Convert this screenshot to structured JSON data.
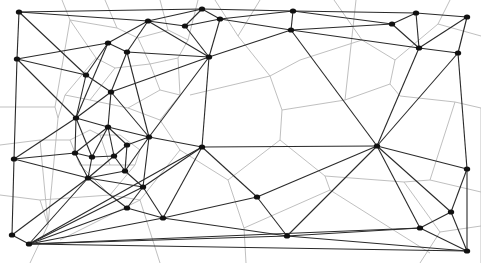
{
  "diagram": {
    "type": "delaunay-voronoi",
    "width": 481,
    "height": 263,
    "colors": {
      "delaunay": "#2a2a2a",
      "voronoi": "#b8b8b8",
      "site": "#111111",
      "background": "#ffffff"
    },
    "nodes": [
      {
        "id": 0,
        "x": 19,
        "y": 12
      },
      {
        "id": 1,
        "x": 17,
        "y": 59
      },
      {
        "id": 2,
        "x": 14,
        "y": 159
      },
      {
        "id": 3,
        "x": 12,
        "y": 235
      },
      {
        "id": 4,
        "x": 29,
        "y": 244
      },
      {
        "id": 5,
        "x": 108,
        "y": 43
      },
      {
        "id": 6,
        "x": 148,
        "y": 21
      },
      {
        "id": 7,
        "x": 127,
        "y": 52
      },
      {
        "id": 8,
        "x": 86,
        "y": 75
      },
      {
        "id": 9,
        "x": 111,
        "y": 92
      },
      {
        "id": 10,
        "x": 76,
        "y": 118
      },
      {
        "id": 11,
        "x": 108,
        "y": 127
      },
      {
        "id": 12,
        "x": 149,
        "y": 137
      },
      {
        "id": 13,
        "x": 127,
        "y": 145
      },
      {
        "id": 14,
        "x": 75,
        "y": 153
      },
      {
        "id": 15,
        "x": 92,
        "y": 157
      },
      {
        "id": 16,
        "x": 114,
        "y": 156
      },
      {
        "id": 17,
        "x": 125,
        "y": 171
      },
      {
        "id": 18,
        "x": 88,
        "y": 178
      },
      {
        "id": 19,
        "x": 143,
        "y": 187
      },
      {
        "id": 20,
        "x": 127,
        "y": 208
      },
      {
        "id": 21,
        "x": 163,
        "y": 218
      },
      {
        "id": 22,
        "x": 202,
        "y": 9
      },
      {
        "id": 23,
        "x": 185,
        "y": 26
      },
      {
        "id": 24,
        "x": 220,
        "y": 19
      },
      {
        "id": 25,
        "x": 209,
        "y": 57
      },
      {
        "id": 26,
        "x": 202,
        "y": 147
      },
      {
        "id": 27,
        "x": 257,
        "y": 197
      },
      {
        "id": 28,
        "x": 287,
        "y": 236
      },
      {
        "id": 29,
        "x": 293,
        "y": 11
      },
      {
        "id": 30,
        "x": 291,
        "y": 30
      },
      {
        "id": 31,
        "x": 392,
        "y": 24
      },
      {
        "id": 32,
        "x": 416,
        "y": 13
      },
      {
        "id": 33,
        "x": 419,
        "y": 48
      },
      {
        "id": 34,
        "x": 467,
        "y": 17
      },
      {
        "id": 35,
        "x": 458,
        "y": 53
      },
      {
        "id": 36,
        "x": 377,
        "y": 146
      },
      {
        "id": 37,
        "x": 467,
        "y": 169
      },
      {
        "id": 38,
        "x": 451,
        "y": 212
      },
      {
        "id": 39,
        "x": 420,
        "y": 228
      },
      {
        "id": 40,
        "x": 467,
        "y": 251
      }
    ],
    "edges": [
      [
        0,
        1
      ],
      [
        0,
        6
      ],
      [
        0,
        8
      ],
      [
        0,
        22
      ],
      [
        1,
        8
      ],
      [
        1,
        10
      ],
      [
        1,
        2
      ],
      [
        1,
        5
      ],
      [
        2,
        14
      ],
      [
        2,
        10
      ],
      [
        2,
        3
      ],
      [
        2,
        18
      ],
      [
        3,
        4
      ],
      [
        3,
        18
      ],
      [
        4,
        18
      ],
      [
        4,
        20
      ],
      [
        4,
        21
      ],
      [
        4,
        28
      ],
      [
        4,
        40
      ],
      [
        4,
        26
      ],
      [
        4,
        19
      ],
      [
        4,
        39
      ],
      [
        5,
        6
      ],
      [
        5,
        8
      ],
      [
        5,
        7
      ],
      [
        5,
        10
      ],
      [
        6,
        22
      ],
      [
        6,
        23
      ],
      [
        6,
        25
      ],
      [
        6,
        7
      ],
      [
        7,
        9
      ],
      [
        7,
        25
      ],
      [
        7,
        12
      ],
      [
        8,
        9
      ],
      [
        8,
        10
      ],
      [
        9,
        10
      ],
      [
        9,
        11
      ],
      [
        9,
        12
      ],
      [
        9,
        25
      ],
      [
        10,
        11
      ],
      [
        10,
        14
      ],
      [
        10,
        15
      ],
      [
        11,
        12
      ],
      [
        11,
        13
      ],
      [
        11,
        15
      ],
      [
        11,
        16
      ],
      [
        11,
        14
      ],
      [
        12,
        13
      ],
      [
        12,
        25
      ],
      [
        12,
        26
      ],
      [
        12,
        19
      ],
      [
        12,
        17
      ],
      [
        13,
        16
      ],
      [
        13,
        17
      ],
      [
        14,
        15
      ],
      [
        14,
        18
      ],
      [
        15,
        16
      ],
      [
        15,
        18
      ],
      [
        16,
        17
      ],
      [
        16,
        18
      ],
      [
        17,
        18
      ],
      [
        17,
        19
      ],
      [
        18,
        20
      ],
      [
        18,
        19
      ],
      [
        19,
        20
      ],
      [
        19,
        21
      ],
      [
        19,
        26
      ],
      [
        20,
        21
      ],
      [
        21,
        26
      ],
      [
        21,
        27
      ],
      [
        21,
        28
      ],
      [
        22,
        23
      ],
      [
        22,
        24
      ],
      [
        22,
        29
      ],
      [
        23,
        25
      ],
      [
        23,
        24
      ],
      [
        24,
        25
      ],
      [
        24,
        30
      ],
      [
        24,
        29
      ],
      [
        25,
        30
      ],
      [
        25,
        26
      ],
      [
        26,
        36
      ],
      [
        26,
        27
      ],
      [
        27,
        36
      ],
      [
        27,
        28
      ],
      [
        28,
        40
      ],
      [
        28,
        39
      ],
      [
        29,
        30
      ],
      [
        29,
        32
      ],
      [
        29,
        31
      ],
      [
        30,
        31
      ],
      [
        30,
        33
      ],
      [
        30,
        36
      ],
      [
        31,
        32
      ],
      [
        31,
        33
      ],
      [
        32,
        33
      ],
      [
        32,
        34
      ],
      [
        33,
        34
      ],
      [
        33,
        35
      ],
      [
        33,
        36
      ],
      [
        34,
        35
      ],
      [
        35,
        36
      ],
      [
        35,
        37
      ],
      [
        36,
        37
      ],
      [
        36,
        38
      ],
      [
        36,
        39
      ],
      [
        36,
        28
      ],
      [
        37,
        38
      ],
      [
        37,
        40
      ],
      [
        38,
        39
      ],
      [
        38,
        40
      ],
      [
        39,
        40
      ]
    ],
    "voronoi_edges": [
      [
        [
          0,
          107
        ],
        [
          55,
          107
        ]
      ],
      [
        [
          55,
          107
        ],
        [
          58,
          118
        ]
      ],
      [
        [
          55,
          107
        ],
        [
          70,
          20
        ]
      ],
      [
        [
          58,
          118
        ],
        [
          48,
          225
        ]
      ],
      [
        [
          70,
          20
        ],
        [
          62,
          0
        ]
      ],
      [
        [
          105,
          0
        ],
        [
          117,
          28
        ]
      ],
      [
        [
          117,
          28
        ],
        [
          70,
          20
        ]
      ],
      [
        [
          117,
          28
        ],
        [
          138,
          38
        ]
      ],
      [
        [
          138,
          38
        ],
        [
          150,
          64
        ]
      ],
      [
        [
          150,
          64
        ],
        [
          115,
          68
        ]
      ],
      [
        [
          115,
          68
        ],
        [
          96,
          58
        ]
      ],
      [
        [
          96,
          58
        ],
        [
          70,
          20
        ]
      ],
      [
        [
          96,
          58
        ],
        [
          65,
          95
        ]
      ],
      [
        [
          65,
          95
        ],
        [
          90,
          100
        ]
      ],
      [
        [
          90,
          100
        ],
        [
          115,
          68
        ]
      ],
      [
        [
          65,
          95
        ],
        [
          58,
          118
        ]
      ],
      [
        [
          150,
          64
        ],
        [
          160,
          90
        ]
      ],
      [
        [
          160,
          90
        ],
        [
          128,
          108
        ]
      ],
      [
        [
          128,
          108
        ],
        [
          90,
          100
        ]
      ],
      [
        [
          160,
          0
        ],
        [
          168,
          30
        ]
      ],
      [
        [
          168,
          30
        ],
        [
          138,
          38
        ]
      ],
      [
        [
          168,
          30
        ],
        [
          188,
          40
        ]
      ],
      [
        [
          188,
          40
        ],
        [
          198,
          0
        ]
      ],
      [
        [
          188,
          40
        ],
        [
          178,
          58
        ]
      ],
      [
        [
          178,
          58
        ],
        [
          150,
          64
        ]
      ],
      [
        [
          178,
          58
        ],
        [
          180,
          95
        ]
      ],
      [
        [
          180,
          95
        ],
        [
          160,
          90
        ]
      ],
      [
        [
          215,
          0
        ],
        [
          238,
          36
        ]
      ],
      [
        [
          238,
          36
        ],
        [
          260,
          0
        ]
      ],
      [
        [
          238,
          36
        ],
        [
          270,
          76
        ]
      ],
      [
        [
          270,
          76
        ],
        [
          190,
          95
        ]
      ],
      [
        [
          270,
          76
        ],
        [
          282,
          110
        ]
      ],
      [
        [
          282,
          110
        ],
        [
          280,
          140
        ]
      ],
      [
        [
          280,
          140
        ],
        [
          228,
          180
        ]
      ],
      [
        [
          228,
          180
        ],
        [
          180,
          150
        ]
      ],
      [
        [
          180,
          150
        ],
        [
          160,
          120
        ]
      ],
      [
        [
          160,
          120
        ],
        [
          180,
          95
        ]
      ],
      [
        [
          282,
          110
        ],
        [
          345,
          100
        ]
      ],
      [
        [
          345,
          100
        ],
        [
          390,
          84
        ]
      ],
      [
        [
          345,
          100
        ],
        [
          356,
          0
        ]
      ],
      [
        [
          390,
          84
        ],
        [
          400,
          96
        ]
      ],
      [
        [
          400,
          96
        ],
        [
          455,
          102
        ]
      ],
      [
        [
          455,
          102
        ],
        [
          481,
          108
        ]
      ],
      [
        [
          390,
          84
        ],
        [
          395,
          60
        ]
      ],
      [
        [
          395,
          60
        ],
        [
          438,
          24
        ]
      ],
      [
        [
          438,
          24
        ],
        [
          450,
          0
        ]
      ],
      [
        [
          438,
          24
        ],
        [
          481,
          36
        ]
      ],
      [
        [
          395,
          60
        ],
        [
          362,
          40
        ]
      ],
      [
        [
          362,
          40
        ],
        [
          334,
          0
        ]
      ],
      [
        [
          362,
          40
        ],
        [
          300,
          60
        ]
      ],
      [
        [
          300,
          60
        ],
        [
          270,
          76
        ]
      ],
      [
        [
          455,
          102
        ],
        [
          430,
          180
        ]
      ],
      [
        [
          430,
          180
        ],
        [
          404,
          182
        ]
      ],
      [
        [
          404,
          182
        ],
        [
          325,
          176
        ]
      ],
      [
        [
          325,
          176
        ],
        [
          280,
          140
        ]
      ],
      [
        [
          430,
          180
        ],
        [
          481,
          192
        ]
      ],
      [
        [
          325,
          176
        ],
        [
          330,
          190
        ]
      ],
      [
        [
          330,
          190
        ],
        [
          430,
          253
        ]
      ],
      [
        [
          404,
          182
        ],
        [
          440,
          232
        ]
      ],
      [
        [
          440,
          232
        ],
        [
          481,
          226
        ]
      ],
      [
        [
          440,
          232
        ],
        [
          420,
          263
        ]
      ],
      [
        [
          330,
          190
        ],
        [
          244,
          228
        ]
      ],
      [
        [
          244,
          228
        ],
        [
          228,
          180
        ]
      ],
      [
        [
          244,
          228
        ],
        [
          246,
          263
        ]
      ],
      [
        [
          160,
          120
        ],
        [
          128,
          108
        ]
      ],
      [
        [
          180,
          150
        ],
        [
          140,
          200
        ]
      ],
      [
        [
          140,
          200
        ],
        [
          60,
          240
        ]
      ],
      [
        [
          140,
          200
        ],
        [
          160,
          263
        ]
      ],
      [
        [
          110,
          195
        ],
        [
          40,
          200
        ]
      ],
      [
        [
          40,
          200
        ],
        [
          0,
          195
        ]
      ],
      [
        [
          40,
          200
        ],
        [
          48,
          225
        ]
      ],
      [
        [
          48,
          225
        ],
        [
          30,
          263
        ]
      ],
      [
        [
          70,
          140
        ],
        [
          40,
          140
        ]
      ],
      [
        [
          40,
          140
        ],
        [
          0,
          145
        ]
      ],
      [
        [
          40,
          140
        ],
        [
          48,
          225
        ]
      ],
      [
        [
          100,
          135
        ],
        [
          120,
          135
        ]
      ],
      [
        [
          120,
          135
        ],
        [
          140,
          150
        ]
      ],
      [
        [
          140,
          150
        ],
        [
          135,
          165
        ]
      ],
      [
        [
          135,
          165
        ],
        [
          110,
          165
        ]
      ],
      [
        [
          110,
          165
        ],
        [
          100,
          135
        ]
      ],
      [
        [
          100,
          135
        ],
        [
          90,
          130
        ]
      ],
      [
        [
          90,
          130
        ],
        [
          70,
          140
        ]
      ],
      [
        [
          70,
          140
        ],
        [
          80,
          165
        ]
      ],
      [
        [
          80,
          165
        ],
        [
          110,
          165
        ]
      ],
      [
        [
          80,
          165
        ],
        [
          110,
          195
        ]
      ],
      [
        [
          110,
          195
        ],
        [
          135,
          165
        ]
      ],
      [
        [
          110,
          195
        ],
        [
          140,
          200
        ]
      ],
      [
        [
          481,
          108
        ],
        [
          481,
          263
        ]
      ]
    ]
  }
}
